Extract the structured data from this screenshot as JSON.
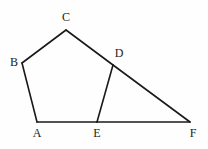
{
  "figure": {
    "kind": "geometry-diagram",
    "background_color": "#fefefe",
    "stroke_color": "#1a1a1a",
    "stroke_width": 1.6,
    "label_color": "#222222",
    "canvas": {
      "width": 208,
      "height": 149
    },
    "points": [
      {
        "name": "A",
        "x": 37,
        "y": 122,
        "label": "A",
        "label_x": 30,
        "label_y": 127
      },
      {
        "name": "B",
        "x": 22,
        "y": 63,
        "label": "B",
        "label_x": 7,
        "label_y": 56
      },
      {
        "name": "C",
        "x": 66,
        "y": 30,
        "label": "C",
        "label_x": 59,
        "label_y": 11
      },
      {
        "name": "D",
        "x": 113,
        "y": 65,
        "label": "D",
        "label_x": 112,
        "label_y": 47
      },
      {
        "name": "E",
        "x": 97,
        "y": 122,
        "label": "E",
        "label_x": 90,
        "label_y": 127
      },
      {
        "name": "F",
        "x": 190,
        "y": 122,
        "label": "F",
        "label_x": 186,
        "label_y": 127
      }
    ],
    "segments": [
      {
        "name": "segment-AB",
        "from": "A",
        "to": "B",
        "x1": 37,
        "y1": 122,
        "x2": 22,
        "y2": 63
      },
      {
        "name": "segment-BC",
        "from": "B",
        "to": "C",
        "x1": 22,
        "y1": 63,
        "x2": 66,
        "y2": 30
      },
      {
        "name": "segment-CD",
        "from": "C",
        "to": "D",
        "x1": 66,
        "y1": 30,
        "x2": 113,
        "y2": 65
      },
      {
        "name": "segment-DE",
        "from": "D",
        "to": "E",
        "x1": 113,
        "y1": 65,
        "x2": 97,
        "y2": 122
      },
      {
        "name": "segment-AE",
        "from": "A",
        "to": "E",
        "x1": 37,
        "y1": 122,
        "x2": 97,
        "y2": 122
      },
      {
        "name": "segment-EF",
        "from": "E",
        "to": "F",
        "x1": 97,
        "y1": 122,
        "x2": 190,
        "y2": 122
      },
      {
        "name": "segment-DF",
        "from": "D",
        "to": "F",
        "x1": 113,
        "y1": 65,
        "x2": 190,
        "y2": 122
      }
    ]
  }
}
